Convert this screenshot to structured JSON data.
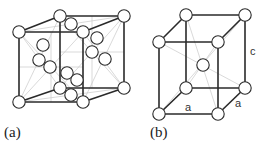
{
  "figure": {
    "panels": [
      {
        "id": "a",
        "label": "(a)",
        "description": "face-centered cubic unit cell",
        "front": {
          "tl": [
            19,
            32
          ],
          "tr": [
            83,
            32
          ],
          "bl": [
            19,
            102
          ],
          "br": [
            83,
            102
          ]
        },
        "back": {
          "tl": [
            60,
            16
          ],
          "tr": [
            124,
            16
          ],
          "bl": [
            60,
            88
          ],
          "br": [
            124,
            88
          ]
        },
        "extra_atoms": [
          [
            71,
            24
          ],
          [
            43,
            45
          ],
          [
            39,
            60
          ],
          [
            50,
            67
          ],
          [
            97,
            38
          ],
          [
            92,
            52
          ],
          [
            105,
            59
          ],
          [
            67,
            73
          ],
          [
            77,
            80
          ],
          [
            71,
            95
          ]
        ]
      },
      {
        "id": "b",
        "label": "(b)",
        "description": "body-centered tetragonal unit cell",
        "front": {
          "tl": [
            159,
            42
          ],
          "tr": [
            218,
            42
          ],
          "bl": [
            159,
            114
          ],
          "br": [
            218,
            114
          ]
        },
        "back": {
          "tl": [
            186,
            15
          ],
          "tr": [
            245,
            15
          ],
          "bl": [
            186,
            88
          ],
          "br": [
            245,
            88
          ]
        },
        "extra_atoms": [
          [
            203,
            65
          ]
        ],
        "dimension_labels": {
          "a_front": "a",
          "a_side": "a",
          "c": "c"
        }
      }
    ]
  }
}
